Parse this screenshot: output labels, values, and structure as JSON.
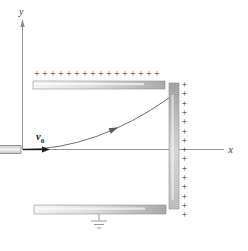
{
  "axes": {
    "x_label": "x",
    "y_label": "y"
  },
  "velocity": {
    "symbol": "v",
    "subscript": "0"
  },
  "charges": {
    "plus_symbol": "+",
    "top_row_count": 16,
    "right_column_count": 15
  },
  "colors": {
    "background": "#ffffff",
    "axis": "#979797",
    "trajectory": "#6f6f6f",
    "velocity_arrow": "#1a1a1a",
    "plus_sign": "#2b2b2b",
    "plate_light": "#f2f2f2",
    "plate_dark": "#a9a9a9",
    "ground": "#9a9a9a"
  }
}
